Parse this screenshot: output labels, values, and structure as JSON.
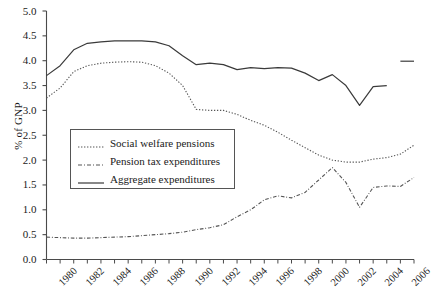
{
  "chart_data": {
    "type": "line",
    "title": "",
    "xlabel": "",
    "ylabel": "% of GNP",
    "xlim": [
      1980,
      2007
    ],
    "ylim": [
      0.0,
      5.0
    ],
    "ytick_step": 0.5,
    "grid": false,
    "legend_position": "center-left-inside",
    "yticks": [
      "0.0",
      "0.5",
      "1.0",
      "1.5",
      "2.0",
      "2.5",
      "3.0",
      "3.5",
      "4.0",
      "4.5",
      "5.0"
    ],
    "xticks": [
      "1980",
      "1982",
      "1984",
      "1986",
      "1988",
      "1990",
      "1992",
      "1994",
      "1996",
      "1998",
      "2000",
      "2002",
      "2004",
      "2006"
    ],
    "x": [
      1980,
      1981,
      1982,
      1983,
      1984,
      1985,
      1986,
      1987,
      1988,
      1989,
      1990,
      1991,
      1992,
      1993,
      1994,
      1995,
      1996,
      1997,
      1998,
      1999,
      2000,
      2001,
      2002,
      2003,
      2004,
      2005,
      2006,
      2007
    ],
    "series": [
      {
        "name": "Social welfare pensions",
        "style": "dotted",
        "color": "#555555",
        "values": [
          3.25,
          3.45,
          3.78,
          3.9,
          3.95,
          3.97,
          3.98,
          3.97,
          3.9,
          3.75,
          3.5,
          3.02,
          3.0,
          3.0,
          2.92,
          2.8,
          2.7,
          2.56,
          2.4,
          2.25,
          2.1,
          2.0,
          1.96,
          1.96,
          2.02,
          2.05,
          2.12,
          2.3
        ]
      },
      {
        "name": "Pension tax expenditures",
        "style": "dash-dot",
        "color": "#555555",
        "values": [
          0.45,
          0.44,
          0.43,
          0.43,
          0.44,
          0.45,
          0.46,
          0.48,
          0.5,
          0.52,
          0.55,
          0.6,
          0.64,
          0.7,
          0.86,
          1.0,
          1.2,
          1.28,
          1.24,
          1.35,
          1.6,
          1.85,
          1.55,
          1.05,
          1.45,
          1.48,
          1.47,
          1.65
        ]
      },
      {
        "name": "Aggregate expenditures",
        "style": "solid",
        "color": "#3a3a3a",
        "values": [
          3.7,
          3.9,
          4.22,
          4.35,
          4.38,
          4.4,
          4.4,
          4.4,
          4.38,
          4.3,
          4.1,
          3.92,
          3.95,
          3.92,
          3.82,
          3.86,
          3.84,
          3.86,
          3.85,
          3.75,
          3.6,
          3.72,
          3.5,
          3.1,
          3.48,
          3.5,
          null,
          null
        ]
      },
      {
        "name": "Aggregate expenditures (later segment)",
        "style": "solid",
        "color": "#3a3a3a",
        "values": [
          null,
          null,
          null,
          null,
          null,
          null,
          null,
          null,
          null,
          null,
          null,
          null,
          null,
          null,
          null,
          null,
          null,
          null,
          null,
          null,
          null,
          null,
          null,
          null,
          null,
          null,
          3.99,
          3.99
        ]
      }
    ],
    "legend": [
      {
        "label": "Social welfare pensions",
        "style": "dotted"
      },
      {
        "label": "Pension tax expenditures",
        "style": "dash-dot"
      },
      {
        "label": "Aggregate expenditures",
        "style": "solid"
      }
    ]
  }
}
